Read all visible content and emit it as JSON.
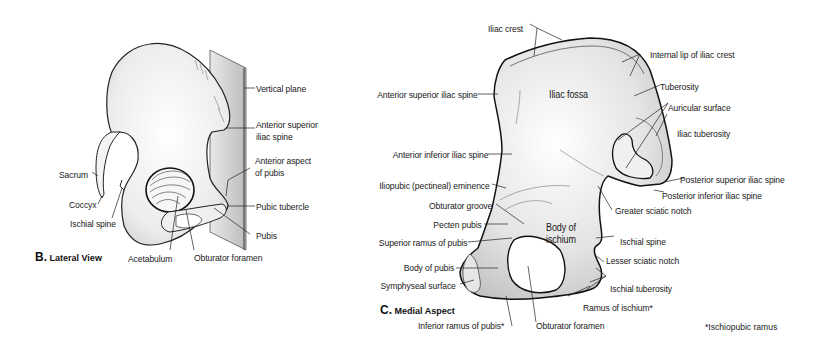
{
  "figure_b": {
    "caption_letter": "B.",
    "caption_text": "Lateral View",
    "labels": {
      "vertical_plane": "Vertical plane",
      "asis_line1": "Anterior superior",
      "asis_line2": "iliac spine",
      "anterior_aspect_line1": "Anterior aspect",
      "anterior_aspect_line2": "of pubis",
      "pubic_tubercle": "Pubic tubercle",
      "pubis": "Pubis",
      "obturator_foramen": "Obturator foramen",
      "acetabulum": "Acetabulum",
      "sacrum": "Sacrum",
      "coccyx": "Coccyx",
      "ischial_spine": "Ischial spine"
    }
  },
  "figure_c": {
    "caption_letter": "C.",
    "caption_text": "Medial Aspect",
    "labels": {
      "iliac_crest": "Iliac crest",
      "internal_lip": "Internal lip of iliac crest",
      "tuberosity": "Tuberosity",
      "auricular_surface": "Auricular surface",
      "iliac_tuberosity": "Iliac tuberosity",
      "psis": "Posterior superior iliac spine",
      "piis": "Posterior inferior iliac spine",
      "greater_sciatic_notch": "Greater sciatic notch",
      "ischial_spine": "Ischial spine",
      "lesser_sciatic_notch": "Lesser sciatic notch",
      "ischial_tuberosity": "Ischial tuberosity",
      "ramus_of_ischium": "Ramus of ischium*",
      "obturator_foramen": "Obturator foramen",
      "inferior_ramus_pubis": "Inferior ramus of pubis*",
      "symphyseal_surface": "Symphyseal surface",
      "body_of_pubis": "Body of pubis",
      "superior_ramus_pubis": "Superior ramus of pubis",
      "pecten_pubis": "Pecten pubis",
      "obturator_groove": "Obturator groove",
      "iliopubic_eminence": "Iliopubic (pectineal) eminence",
      "aiis": "Anterior inferior iliac spine",
      "asis": "Anterior superior iliac spine",
      "iliac_fossa": "Iliac fossa",
      "body_of_ischium_line1": "Body of",
      "body_of_ischium_line2": "ischium"
    },
    "footnote": "*Ischiopubic ramus"
  }
}
